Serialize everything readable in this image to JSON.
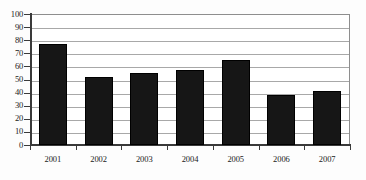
{
  "chart_data": {
    "type": "bar",
    "title": "",
    "subtitle": "",
    "xlabel": "",
    "ylabel": "",
    "categories": [
      "2001",
      "2002",
      "2003",
      "2004",
      "2005",
      "2006",
      "2007"
    ],
    "values": [
      77,
      52,
      55,
      57,
      65,
      38,
      41
    ],
    "series": [
      {
        "name": "",
        "values": [
          77,
          52,
          55,
          57,
          65,
          38,
          41
        ]
      }
    ],
    "ylim": [
      0,
      100
    ],
    "ytick_step": 10,
    "yticks": [
      "0",
      "10",
      "20",
      "30",
      "40",
      "50",
      "60",
      "70",
      "80",
      "90",
      "100"
    ],
    "grid": true,
    "grid_axis": "y",
    "legend": false,
    "legend_position": "none",
    "bar_color": "#161616",
    "grid_color": "#a8a8a8",
    "axis_color": "#3a3a3a",
    "frame_color": "#8e8e8e",
    "background_color": "#ffffff"
  }
}
